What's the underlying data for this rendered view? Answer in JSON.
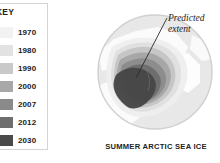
{
  "legend": {
    "title": "KEY",
    "items": [
      {
        "year": "1970",
        "color": "#f2f2f2"
      },
      {
        "year": "1980",
        "color": "#e2e2e2"
      },
      {
        "year": "1990",
        "color": "#c9c9c9"
      },
      {
        "year": "2000",
        "color": "#a8a8a8"
      },
      {
        "year": "2007",
        "color": "#8a8a8a"
      },
      {
        "year": "2012",
        "color": "#6e6e6e"
      },
      {
        "year": "2030",
        "color": "#4a4a4a"
      }
    ]
  },
  "globe": {
    "name": "arctic-globe",
    "ocean_color": "#e8e8e8",
    "land_color": "#fbfbfb",
    "outline_color": "#d0d0d0",
    "ice_rings": [
      {
        "year": "1970",
        "color": "#eeeeee"
      },
      {
        "year": "1980",
        "color": "#dedede"
      },
      {
        "year": "1990",
        "color": "#c4c4c4"
      },
      {
        "year": "2000",
        "color": "#a5a5a5"
      },
      {
        "year": "2007",
        "color": "#8b8b8b"
      },
      {
        "year": "2012",
        "color": "#6d6d6d"
      },
      {
        "year": "2030",
        "color": "#474747"
      }
    ]
  },
  "annotation": {
    "line1": "Predicted",
    "line2": "extent"
  },
  "caption": {
    "text": "SUMMER ARCTIC SEA ICE"
  }
}
